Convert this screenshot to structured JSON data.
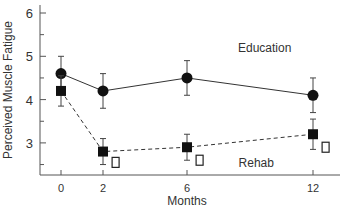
{
  "chart_data": {
    "type": "line",
    "title": "",
    "xlabel": "Months",
    "ylabel": "Perceived Muscle Fatigue",
    "x": [
      0,
      2,
      6,
      12
    ],
    "xticks": [
      "0",
      "2",
      "6",
      "12"
    ],
    "yticks": [
      "3",
      "4",
      "5",
      "6"
    ],
    "ylim": [
      2.25,
      6.2
    ],
    "xlim": [
      -1,
      13.5
    ],
    "grid": false,
    "series": [
      {
        "name": "Education",
        "marker": "filled-circle",
        "line": "solid",
        "values": [
          4.6,
          4.2,
          4.5,
          4.1
        ],
        "errors": [
          0.4,
          0.4,
          0.4,
          0.4
        ]
      },
      {
        "name": "Rehab",
        "marker": "filled-square",
        "line": "dashed",
        "values": [
          4.2,
          2.8,
          2.9,
          3.2
        ],
        "errors": [
          0.35,
          0.3,
          0.3,
          0.35
        ]
      },
      {
        "name": "Rehab (open)",
        "marker": "open-square",
        "line": "none",
        "x": [
          2.6,
          6.6,
          12.6
        ],
        "values": [
          2.55,
          2.6,
          2.9
        ]
      }
    ],
    "annotations": [
      {
        "text": "Education",
        "x": 9.7,
        "y": 5.1
      },
      {
        "text": "Rehab",
        "x": 9.3,
        "y": 2.45
      }
    ]
  }
}
